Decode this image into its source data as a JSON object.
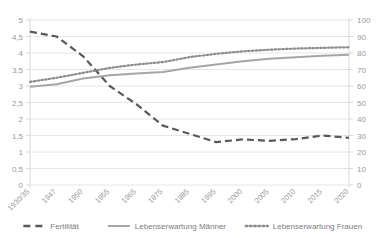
{
  "chart_data": {
    "type": "line",
    "title": "",
    "subtitle": "",
    "xlabel": "",
    "ylabel": "",
    "grid": true,
    "legend_position": "bottom",
    "categories": [
      "1930/35",
      "1947",
      "1950",
      "1955",
      "1965",
      "1975",
      "1985",
      "1995",
      "2000",
      "2005",
      "2010",
      "2015",
      "2020"
    ],
    "axes": {
      "left": {
        "name": "Fertilität",
        "ylim": [
          0,
          5
        ],
        "ticks": [
          "0",
          "0,5",
          "1",
          "1,5",
          "2",
          "2,5",
          "3",
          "3,5",
          "4",
          "4,5",
          "5"
        ],
        "tick_values": [
          0,
          0.5,
          1,
          1.5,
          2,
          2.5,
          3,
          3.5,
          4,
          4.5,
          5
        ]
      },
      "right": {
        "name": "Lebenserwartung",
        "ylim": [
          0,
          100
        ],
        "ticks": [
          "0",
          "10",
          "20",
          "30",
          "40",
          "50",
          "60",
          "70",
          "80",
          "90",
          "100"
        ],
        "tick_values": [
          0,
          10,
          20,
          30,
          40,
          50,
          60,
          70,
          80,
          90,
          100
        ]
      }
    },
    "series": [
      {
        "name": "Fertilität",
        "axis": "left",
        "style": "dashed",
        "color": "#595959",
        "values": [
          4.65,
          4.5,
          3.9,
          3.0,
          2.45,
          1.8,
          1.55,
          1.3,
          1.38,
          1.34,
          1.39,
          1.5,
          1.43
        ]
      },
      {
        "name": "Lebenserwartung Männer",
        "axis": "right",
        "style": "solid",
        "color": "#a6a6a6",
        "values": [
          59.5,
          61.0,
          64.5,
          66.5,
          67.5,
          68.5,
          71.0,
          73.0,
          75.0,
          76.5,
          77.5,
          78.3,
          79.0
        ]
      },
      {
        "name": "Lebenserwartung Frauen",
        "axis": "right",
        "style": "dotted",
        "color": "#8c8c8c",
        "values": [
          62.5,
          65.0,
          68.0,
          71.0,
          73.0,
          74.5,
          77.5,
          79.5,
          81.0,
          82.0,
          82.7,
          83.1,
          83.5
        ]
      }
    ]
  },
  "legend": {
    "items": [
      {
        "label": "Fertilität",
        "style": "dashed",
        "color": "#595959"
      },
      {
        "label": "Lebenserwartung Männer",
        "style": "solid",
        "color": "#a6a6a6"
      },
      {
        "label": "Lebenserwartung Frauen",
        "style": "dotted",
        "color": "#8c8c8c"
      }
    ]
  },
  "colors": {
    "grid": "#e6e6e6",
    "axis": "#d9d9d9",
    "tick_text": "#9a9a9a",
    "legend_text": "#7d7d7d",
    "background": "#ffffff"
  }
}
